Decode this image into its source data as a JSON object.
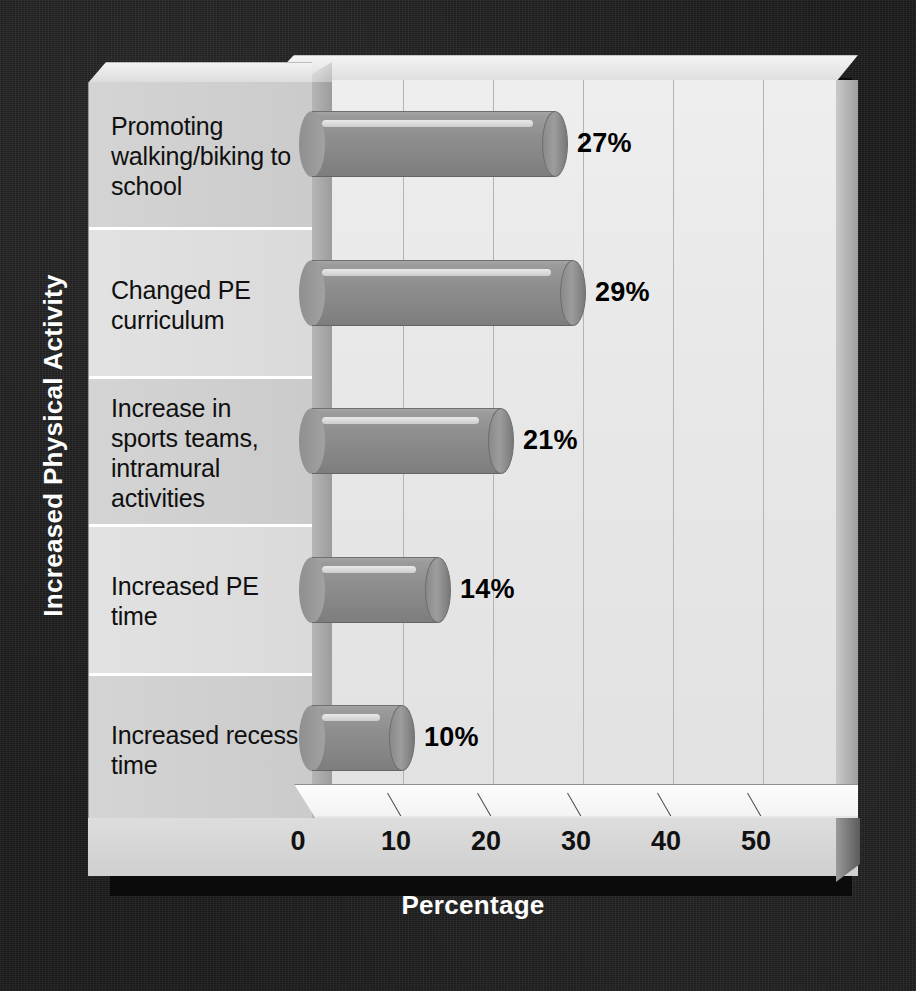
{
  "chart_data": {
    "type": "bar",
    "orientation": "horizontal",
    "title": "",
    "xlabel": "Percentage",
    "ylabel": "Increased Physical Activity",
    "categories": [
      "Promoting walking/biking to school",
      "Changed PE curriculum",
      "Increase in sports teams, intramural activities",
      "Increased PE time",
      "Increased recess time"
    ],
    "values": [
      27,
      29,
      21,
      14,
      10
    ],
    "value_labels": [
      "27%",
      "29%",
      "21%",
      "14%",
      "10%"
    ],
    "xticks": [
      0,
      10,
      20,
      30,
      40,
      50
    ],
    "xtick_labels": [
      "0",
      "10",
      "20",
      "30",
      "40",
      "50"
    ],
    "xlim": [
      0,
      57
    ],
    "grid": true,
    "grid_axis": "x",
    "legend": "none",
    "style_3d": true,
    "colors": {
      "background": "#1c1c1c",
      "plot_area": "#e8e8e8",
      "bar_fill": "#8e8e8e",
      "bar_edge": "#6d6d6d",
      "gridline": "#b3b3b3",
      "axis_title_text": "#ffffff",
      "tick_text": "#111111",
      "category_panel": "#d4d4d4",
      "separator": "#ffffff"
    }
  }
}
